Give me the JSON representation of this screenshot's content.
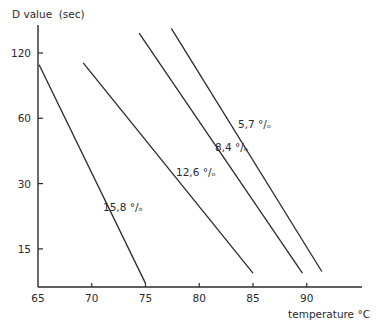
{
  "chart_data": {
    "type": "line",
    "title": "",
    "ylabel": "D value  (sec)",
    "xlabel": "temperature °C",
    "yscale": "log",
    "x_ticks": [
      65,
      70,
      75,
      80,
      85,
      90
    ],
    "y_ticks": [
      15,
      30,
      60,
      120
    ],
    "x_tick_labels": [
      "65",
      "70",
      "75",
      "80",
      "85",
      "90"
    ],
    "y_tick_labels": [
      "15",
      "30",
      "60",
      "120"
    ],
    "xlim": [
      65,
      95
    ],
    "ylim": [
      10,
      170
    ],
    "grid": false,
    "legend": "inline labels on lines",
    "series": [
      {
        "name": "15,8 °/ₒ",
        "label": "15,8 °/ₒ",
        "x": [
          65.1,
          75.0
        ],
        "y": [
          106,
          10.4
        ]
      },
      {
        "name": "12,6 °/ₒ",
        "label": "12,6 °/ₒ",
        "x": [
          69.2,
          85.0
        ],
        "y": [
          108,
          11.6
        ]
      },
      {
        "name": "8,4 °/ₒ",
        "label": "8,4 °/ₒ",
        "x": [
          74.4,
          89.6
        ],
        "y": [
          148,
          11.6
        ]
      },
      {
        "name": "5,7 °/ₒ",
        "label": "5,7 °/ₒ",
        "x": [
          77.4,
          91.4
        ],
        "y": [
          156,
          11.8
        ]
      }
    ]
  },
  "colors": {
    "ink": "#2a2a2a",
    "background": "#ffffff"
  }
}
